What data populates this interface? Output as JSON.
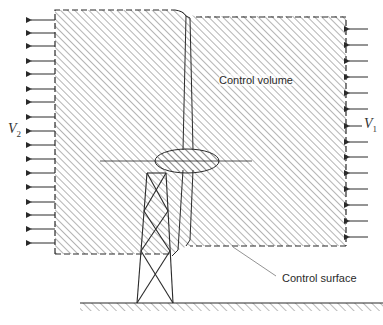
{
  "diagram": {
    "labels": {
      "control_volume": "Control volume",
      "control_surface": "Control surface",
      "downstream_velocity": "V",
      "downstream_subscript": "2",
      "upstream_velocity": "V",
      "upstream_subscript": "1"
    },
    "left_arrow_count": 17,
    "right_arrow_count": 14,
    "colors": {
      "line": "#2a2a2a",
      "hatch": "#6a6a6a",
      "background": "#ffffff"
    }
  }
}
